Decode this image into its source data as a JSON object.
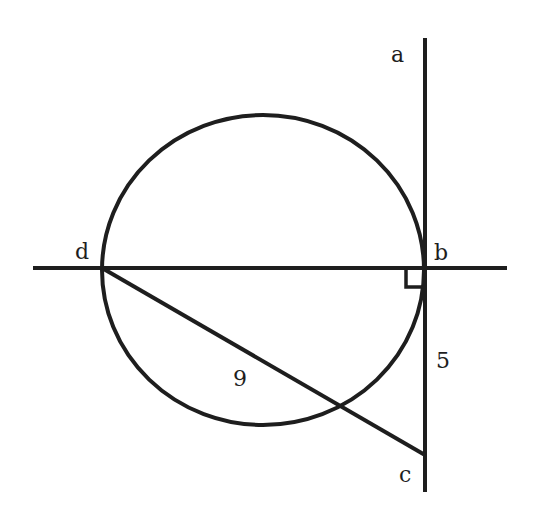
{
  "diagram": {
    "type": "geometry",
    "stroke_color": "#1e1e1e",
    "background": "#ffffff",
    "points": {
      "a": {
        "label": "a",
        "x": 425,
        "y": 38
      },
      "b": {
        "label": "b",
        "x": 425,
        "y": 268
      },
      "c": {
        "label": "c",
        "x": 425,
        "y": 455
      },
      "d": {
        "label": "d",
        "x": 102,
        "y": 268
      }
    },
    "circle": {
      "cx": 263,
      "cy": 270,
      "rx": 161,
      "ry": 155
    },
    "lines": [
      {
        "name": "horizontal-line",
        "x1": 33,
        "y1": 268,
        "x2": 507,
        "y2": 268
      },
      {
        "name": "vertical-tangent-line",
        "x1": 425,
        "y1": 38,
        "x2": 425,
        "y2": 492
      },
      {
        "name": "segment-dc",
        "x1": 102,
        "y1": 268,
        "x2": 425,
        "y2": 455
      }
    ],
    "right_angle_marker": {
      "at": "b",
      "x": 406,
      "y": 268,
      "size": 19
    },
    "measurements": [
      {
        "segment": "dc",
        "label": "9"
      },
      {
        "segment": "bc",
        "label": "5"
      }
    ],
    "labels": {
      "a": "a",
      "b": "b",
      "c": "c",
      "d": "d",
      "dc_length": "9",
      "bc_length": "5"
    }
  }
}
